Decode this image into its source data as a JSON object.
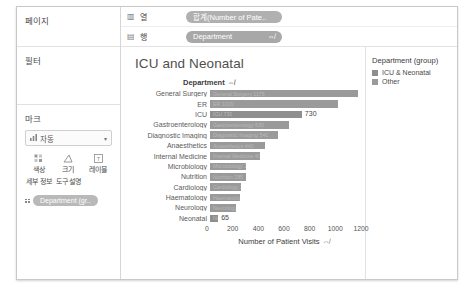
{
  "sidebar": {
    "pages": {
      "title": "페이지"
    },
    "filters": {
      "title": "필터"
    },
    "marks": {
      "title": "마크",
      "mark_type": "자동",
      "mark_type_icon": "bar-mark-icon",
      "caret": "▾",
      "buttons": [
        {
          "label": "색상",
          "icon": "color-icon"
        },
        {
          "label": "크기",
          "icon": "size-icon"
        },
        {
          "label": "레이블",
          "icon": "label-icon"
        },
        {
          "label": "세부 정보",
          "icon": "detail-icon"
        },
        {
          "label": "도구 설명",
          "icon": "tooltip-icon"
        }
      ],
      "pill": "Department (gr..",
      "pill_icon": "detail-icon"
    }
  },
  "shelves": [
    {
      "name": "열",
      "icon": "columns-icon",
      "pill": "합계(Number of Pate..",
      "pill_sort": ""
    },
    {
      "name": "행",
      "icon": "rows-icon",
      "pill": "Department",
      "pill_sort": "⇎"
    }
  ],
  "viz": {
    "title": "ICU and Neonatal",
    "field_header": "Department",
    "field_sort_icon": "⇎"
  },
  "legend": {
    "title": "Department (group)",
    "items": [
      {
        "label": "ICU & Neonatal",
        "color": "#8e8e8e"
      },
      {
        "label": "Other",
        "color": "#9a9a9a"
      }
    ]
  },
  "chart_data": {
    "type": "bar",
    "orientation": "horizontal",
    "title": "ICU and Neonatal",
    "xlabel": "Number of Patient Visits",
    "ylabel": "Department",
    "xlim": [
      0,
      1200
    ],
    "xticks": [
      0,
      200,
      400,
      600,
      800,
      1000,
      1200
    ],
    "grid": false,
    "legend_position": "right",
    "categories": [
      "General Surgery",
      "ER",
      "ICU",
      "Gastroenterology",
      "Diagnostic Imaging",
      "Anaesthetics",
      "Internal Medicine",
      "Microbiology",
      "Nutrition",
      "Cardiology",
      "Haematology",
      "Neurology",
      "Neonatal"
    ],
    "values": [
      1175,
      1020,
      730,
      630,
      540,
      440,
      400,
      290,
      285,
      250,
      235,
      205,
      65
    ],
    "groups": [
      "Other",
      "Other",
      "ICU & Neonatal",
      "Other",
      "Other",
      "Other",
      "Other",
      "Other",
      "Other",
      "Other",
      "Other",
      "Other",
      "ICU & Neonatal"
    ],
    "data_labels": [
      {
        "category": "ICU",
        "value": "730"
      },
      {
        "category": "Neonatal",
        "value": "65"
      }
    ]
  }
}
